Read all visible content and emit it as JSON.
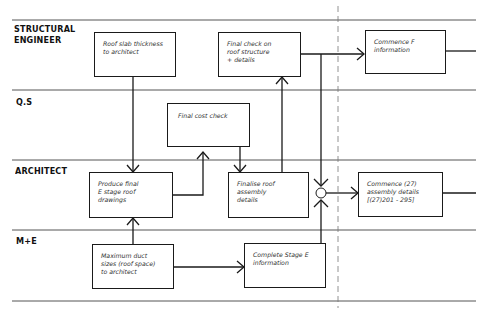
{
  "lanes": [
    {
      "label_line1": "STRUCTURAL",
      "label_line2": "ENGINEER"
    },
    {
      "label_line1": "Q.S",
      "label_line2": ""
    },
    {
      "label_line1": "ARCHITECT",
      "label_line2": ""
    },
    {
      "label_line1": "M+E",
      "label_line2": ""
    }
  ],
  "boxes": {
    "roof_slab": {
      "line1": "Roof slab thickness",
      "line2": "to architect",
      "line3": ""
    },
    "final_check": {
      "line1": "Final check on",
      "line2": "roof structure",
      "line3": "+ details"
    },
    "commence_f": {
      "line1": "Commence F",
      "line2": "information",
      "line3": ""
    },
    "final_cost": {
      "line1": "Final cost check",
      "line2": "",
      "line3": ""
    },
    "produce_final": {
      "line1": "Produce final",
      "line2": "E stage roof",
      "line3": "drawings"
    },
    "finalise_roof": {
      "line1": "Finalise roof",
      "line2": "assembly",
      "line3": "details"
    },
    "commence_27": {
      "line1": "Commence (27)",
      "line2": "assembly details",
      "line3": "[(27)201 - 295]"
    },
    "maximum_duct": {
      "line1": "Maximum duct",
      "line2": "sizes (roof space)",
      "line3": "to architect"
    },
    "complete_stage_e": {
      "line1": "Complete Stage E",
      "line2": "information",
      "line3": ""
    }
  },
  "colors": {
    "ink": "#1a1a1a",
    "lane_line": "#555555",
    "background": "#ffffff"
  }
}
